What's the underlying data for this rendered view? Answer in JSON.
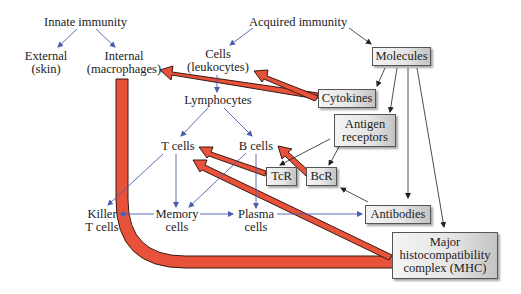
{
  "diagram": {
    "nodes": {
      "innate_immunity": "Innate immunity",
      "external_1": "External",
      "external_2": "(skin)",
      "internal_1": "Internal",
      "internal_2": "(macrophages)",
      "acquired_immunity": "Acquired immunity",
      "cells_1": "Cells",
      "cells_2": "(leukocytes)",
      "lymphocytes": "Lymphocytes",
      "t_cells": "T cells",
      "b_cells": "B cells",
      "killer_1": "Killer",
      "killer_2": "T cells",
      "memory_1": "Memory",
      "memory_2": "cells",
      "plasma_1": "Plasma",
      "plasma_2": "cells",
      "molecules": "Molecules",
      "cytokines": "Cytokines",
      "antigen_receptors_1": "Antigen",
      "antigen_receptors_2": "receptors",
      "tcr": "TcR",
      "bcr": "BcR",
      "antibodies": "Antibodies",
      "mhc_1": "Major",
      "mhc_2": "histocompatibility",
      "mhc_3": "complex (MHC)"
    },
    "colors": {
      "blue_arrow": "#4a5fb0",
      "black_arrow": "#222222",
      "red_arrow_fill": "#e8523a",
      "red_arrow_stroke": "#3a1a12"
    },
    "edges": [
      {
        "from": "Innate immunity",
        "to": "External (skin)",
        "type": "blue"
      },
      {
        "from": "Innate immunity",
        "to": "Internal (macrophages)",
        "type": "blue"
      },
      {
        "from": "Acquired immunity",
        "to": "Cells (leukocytes)",
        "type": "blue"
      },
      {
        "from": "Acquired immunity",
        "to": "Molecules",
        "type": "black"
      },
      {
        "from": "Cells (leukocytes)",
        "to": "Lymphocytes",
        "type": "blue"
      },
      {
        "from": "Lymphocytes",
        "to": "T cells",
        "type": "blue"
      },
      {
        "from": "Lymphocytes",
        "to": "B cells",
        "type": "blue"
      },
      {
        "from": "T cells",
        "to": "Killer T cells",
        "type": "blue"
      },
      {
        "from": "T cells",
        "to": "Memory cells",
        "type": "blue"
      },
      {
        "from": "B cells",
        "to": "Memory cells",
        "type": "blue"
      },
      {
        "from": "B cells",
        "to": "Plasma cells",
        "type": "blue"
      },
      {
        "from": "Memory cells",
        "to": "Killer T cells",
        "type": "blue"
      },
      {
        "from": "Memory cells",
        "to": "Plasma cells",
        "type": "blue"
      },
      {
        "from": "Plasma cells",
        "to": "Antibodies",
        "type": "blue"
      },
      {
        "from": "Molecules",
        "to": "Cytokines",
        "type": "black"
      },
      {
        "from": "Molecules",
        "to": "Antigen receptors",
        "type": "black"
      },
      {
        "from": "Molecules",
        "to": "Antibodies",
        "type": "black"
      },
      {
        "from": "Molecules",
        "to": "MHC",
        "type": "black"
      },
      {
        "from": "Antigen receptors",
        "to": "TcR",
        "type": "black"
      },
      {
        "from": "Antigen receptors",
        "to": "BcR",
        "type": "black"
      },
      {
        "from": "Antibodies",
        "to": "BcR",
        "type": "black"
      },
      {
        "from": "Cytokines",
        "to": "Internal (macrophages)",
        "type": "red"
      },
      {
        "from": "Cytokines",
        "to": "Cells (leukocytes)",
        "type": "red"
      },
      {
        "from": "TcR",
        "to": "T cells",
        "type": "red"
      },
      {
        "from": "BcR",
        "to": "B cells",
        "type": "red"
      },
      {
        "from": "MHC",
        "to": "T cells",
        "type": "red"
      },
      {
        "from": "Internal (macrophages)",
        "to": "MHC",
        "type": "red"
      }
    ]
  }
}
